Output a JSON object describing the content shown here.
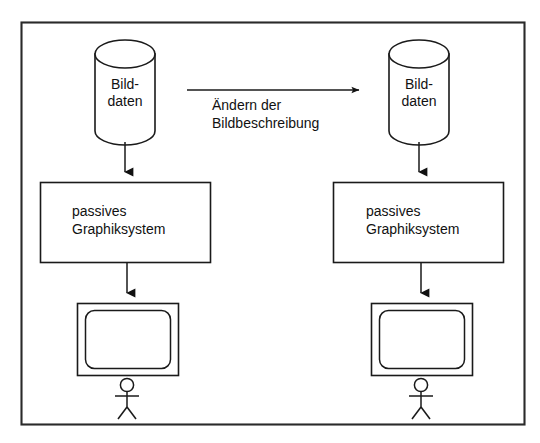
{
  "diagram": {
    "frame": {
      "name": "outer-frame",
      "x": 21,
      "y": 22,
      "width": 504,
      "height": 403,
      "border_color": "#2a2a2a",
      "background": "#ffffff"
    },
    "colors": {
      "stroke": "#1a1a1a",
      "frame_stroke": "#2a2a2a",
      "text": "#111111",
      "background": "#ffffff"
    },
    "left_stage": {
      "name": "left-pipeline",
      "datastore": {
        "label_line1": "Bild-",
        "label_line2": "daten",
        "shape": "cylinder"
      },
      "process": {
        "label_line1": "passives",
        "label_line2": "Graphiksystem",
        "shape": "rectangle"
      },
      "display": {
        "label": "",
        "shape": "monitor"
      },
      "actor": {
        "label": "",
        "shape": "stick-figure"
      }
    },
    "right_stage": {
      "name": "right-pipeline",
      "datastore": {
        "label_line1": "Bild-",
        "label_line2": "daten",
        "shape": "cylinder"
      },
      "process": {
        "label_line1": "passives",
        "label_line2": "Graphiksystem",
        "shape": "rectangle"
      },
      "display": {
        "label": "",
        "shape": "monitor"
      },
      "actor": {
        "label": "",
        "shape": "stick-figure"
      }
    },
    "transition": {
      "name": "transition-arrow",
      "label_line1": "Ändern der",
      "label_line2": "Bildbeschreibung",
      "direction": "left-to-right"
    },
    "connectors": [
      {
        "name": "left-datastore-to-process",
        "direction": "down"
      },
      {
        "name": "left-process-to-display",
        "direction": "down"
      },
      {
        "name": "right-datastore-to-process",
        "direction": "down"
      },
      {
        "name": "right-process-to-display",
        "direction": "down"
      }
    ]
  }
}
